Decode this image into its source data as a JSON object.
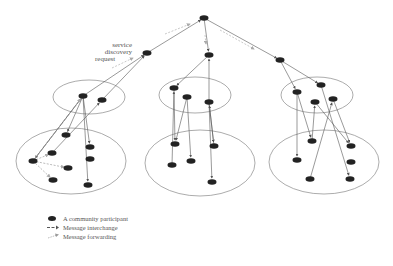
{
  "diagram": {
    "annotation": {
      "lines": [
        "service",
        "discovery",
        "request"
      ]
    },
    "colors": {
      "node": "#222222",
      "ellipse": "#888888",
      "edge": "#555555",
      "forward": "#aaaaaa"
    },
    "clusters": [
      {
        "name": "left-upper",
        "cx": 89,
        "cy": 97,
        "rx": 36,
        "ry": 17
      },
      {
        "name": "left-lower",
        "cx": 71,
        "cy": 161,
        "rx": 55,
        "ry": 33
      },
      {
        "name": "middle-upper",
        "cx": 195,
        "cy": 95,
        "rx": 36,
        "ry": 18
      },
      {
        "name": "middle-lower",
        "cx": 200,
        "cy": 163,
        "rx": 55,
        "ry": 33
      },
      {
        "name": "right-upper",
        "cx": 317,
        "cy": 95,
        "rx": 36,
        "ry": 18
      },
      {
        "name": "right-lower",
        "cx": 324,
        "cy": 162,
        "rx": 55,
        "ry": 32
      }
    ],
    "nodes": [
      {
        "id": "root",
        "x": 204,
        "y": 18
      },
      {
        "id": "l1",
        "x": 147,
        "y": 53
      },
      {
        "id": "m1",
        "x": 209,
        "y": 55
      },
      {
        "id": "r1",
        "x": 280,
        "y": 60
      },
      {
        "id": "lu1",
        "x": 83,
        "y": 96
      },
      {
        "id": "lu2",
        "x": 102,
        "y": 100
      },
      {
        "id": "mu1",
        "x": 174,
        "y": 88
      },
      {
        "id": "mu2",
        "x": 187,
        "y": 97
      },
      {
        "id": "mu3",
        "x": 209,
        "y": 102
      },
      {
        "id": "ru1",
        "x": 297,
        "y": 92
      },
      {
        "id": "ru2",
        "x": 321,
        "y": 85
      },
      {
        "id": "ru3",
        "x": 315,
        "y": 102
      },
      {
        "id": "ru4",
        "x": 333,
        "y": 99
      },
      {
        "id": "ll1",
        "x": 66,
        "y": 135
      },
      {
        "id": "ll2",
        "x": 52,
        "y": 153
      },
      {
        "id": "ll3",
        "x": 33,
        "y": 161
      },
      {
        "id": "ll4",
        "x": 68,
        "y": 168
      },
      {
        "id": "ll5",
        "x": 53,
        "y": 180
      },
      {
        "id": "ll6",
        "x": 90,
        "y": 147
      },
      {
        "id": "ll7",
        "x": 90,
        "y": 159
      },
      {
        "id": "ll8",
        "x": 88,
        "y": 185
      },
      {
        "id": "ml1",
        "x": 175,
        "y": 144
      },
      {
        "id": "ml2",
        "x": 172,
        "y": 165
      },
      {
        "id": "ml3",
        "x": 191,
        "y": 161
      },
      {
        "id": "ml4",
        "x": 214,
        "y": 146
      },
      {
        "id": "ml5",
        "x": 212,
        "y": 182
      },
      {
        "id": "rl1",
        "x": 312,
        "y": 141
      },
      {
        "id": "rl2",
        "x": 351,
        "y": 146
      },
      {
        "id": "rl3",
        "x": 297,
        "y": 160
      },
      {
        "id": "rl4",
        "x": 351,
        "y": 162
      },
      {
        "id": "rl5",
        "x": 310,
        "y": 179
      },
      {
        "id": "rl6",
        "x": 350,
        "y": 179
      }
    ],
    "edges": [
      {
        "from": "l1",
        "to": "root",
        "style": "solid"
      },
      {
        "from": "root",
        "to": "m1",
        "style": "solid"
      },
      {
        "from": "root",
        "to": "r1",
        "style": "solid"
      },
      {
        "from": "lu1",
        "to": "l1",
        "style": "solid"
      },
      {
        "from": "lu2",
        "to": "l1",
        "style": "solid"
      },
      {
        "from": "m1",
        "to": "mu1",
        "style": "solid"
      },
      {
        "from": "mu3",
        "to": "m1",
        "style": "solid"
      },
      {
        "from": "r1",
        "to": "ru1",
        "style": "solid"
      },
      {
        "from": "r1",
        "to": "ru2",
        "style": "solid"
      },
      {
        "from": "lu1",
        "to": "ll3",
        "style": "solid"
      },
      {
        "from": "lu1",
        "to": "ll1",
        "style": "solid"
      },
      {
        "from": "lu1",
        "to": "ll6",
        "style": "solid"
      },
      {
        "from": "ll2",
        "to": "lu2",
        "style": "solid"
      },
      {
        "from": "lu1",
        "to": "ll8",
        "style": "solid"
      },
      {
        "from": "ll3",
        "to": "lu1",
        "style": "solid"
      },
      {
        "from": "ml2",
        "to": "mu1",
        "style": "solid"
      },
      {
        "from": "mu1",
        "to": "ml1",
        "style": "solid"
      },
      {
        "from": "mu2",
        "to": "ml1",
        "style": "solid"
      },
      {
        "from": "mu2",
        "to": "ml3",
        "style": "solid"
      },
      {
        "from": "mu3",
        "to": "ml4",
        "style": "solid"
      },
      {
        "from": "mu3",
        "to": "ml5",
        "style": "solid"
      },
      {
        "from": "ml4",
        "to": "mu3",
        "style": "solid"
      },
      {
        "from": "ru1",
        "to": "rl1",
        "style": "solid"
      },
      {
        "from": "ru1",
        "to": "rl3",
        "style": "solid"
      },
      {
        "from": "ru3",
        "to": "rl2",
        "style": "solid"
      },
      {
        "from": "rl1",
        "to": "ru3",
        "style": "solid"
      },
      {
        "from": "ru4",
        "to": "rl2",
        "style": "solid"
      },
      {
        "from": "rl5",
        "to": "ru4",
        "style": "solid"
      },
      {
        "from": "ru2",
        "to": "rl6",
        "style": "solid"
      },
      {
        "from": "ll3",
        "to": "ll4",
        "style": "forward"
      },
      {
        "from": "ll3",
        "to": "ll5",
        "style": "forward"
      },
      {
        "from": "ll3",
        "to": "ll2",
        "style": "forward"
      },
      {
        "from": "ll3",
        "to": "lu1",
        "style": "forward"
      }
    ],
    "request_markers": [
      {
        "x1": 112,
        "y1": 68,
        "x2": 133,
        "y2": 58
      },
      {
        "x1": 165,
        "y1": 34,
        "x2": 190,
        "y2": 24
      },
      {
        "x1": 205,
        "y1": 35,
        "x2": 206,
        "y2": 44
      },
      {
        "x1": 220,
        "y1": 30,
        "x2": 254,
        "y2": 49
      }
    ]
  },
  "legend": {
    "items": [
      {
        "symbol": "node",
        "label": "A community participant"
      },
      {
        "symbol": "interchange",
        "label": "Message interchange"
      },
      {
        "symbol": "forwarding",
        "label": "Message forwarding"
      }
    ]
  }
}
